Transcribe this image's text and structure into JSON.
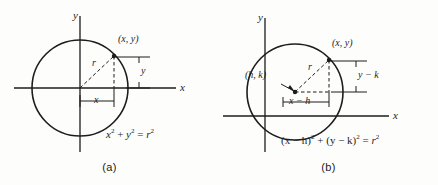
{
  "figure": {
    "background_color": "#fdfdfc",
    "ink_color": "#1d1d1d"
  },
  "panels": [
    {
      "id": "a",
      "caption": "(a)",
      "axis_labels": {
        "x": "x",
        "y": "y"
      },
      "point_label": "(x, y)",
      "radius_label": "r",
      "horizontal_dim_label": "x",
      "vertical_dim_label": "y",
      "equation": {
        "full": "x² + y² = r²",
        "parts": [
          {
            "base": "x",
            "sup": "2"
          },
          {
            "base": " + ",
            "sup": ""
          },
          {
            "base": "y",
            "sup": "2"
          },
          {
            "base": " = ",
            "sup": ""
          },
          {
            "base": "r",
            "sup": "2"
          }
        ]
      },
      "geometry": {
        "origin": [
          80,
          88
        ],
        "circle_center": [
          80,
          88
        ],
        "circle_radius": 48,
        "point": [
          114,
          56
        ]
      }
    },
    {
      "id": "b",
      "caption": "(b)",
      "axis_labels": {
        "x": "x",
        "y": "y"
      },
      "point_label": "(x, y)",
      "center_label": "(h, k)",
      "radius_label": "r",
      "horizontal_dim_label": "x − h",
      "vertical_dim_label": "y − k",
      "equation": {
        "full": "(x − h)² + (y − k)² = r²",
        "parts": [
          {
            "base": "(x − h)",
            "sup": "2"
          },
          {
            "base": " + ",
            "sup": ""
          },
          {
            "base": "(y − k)",
            "sup": "2"
          },
          {
            "base": " = ",
            "sup": ""
          },
          {
            "base": "r",
            "sup": "2"
          }
        ]
      },
      "geometry": {
        "origin": [
          46,
          116
        ],
        "circle_center": [
          76,
          92
        ],
        "circle_radius": 48,
        "point": [
          110,
          60
        ]
      }
    }
  ]
}
